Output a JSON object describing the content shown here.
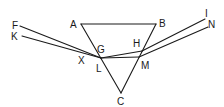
{
  "diagram": {
    "title": "",
    "type": "geometric-optics-prism",
    "colors": {
      "stroke": "#1a1a1a",
      "background": "#ffffff"
    },
    "points": {
      "A": {
        "label": "A",
        "x": 81,
        "y": 24,
        "lx": 70,
        "ly": 28
      },
      "B": {
        "label": "B",
        "x": 156,
        "y": 24,
        "lx": 159,
        "ly": 27
      },
      "C": {
        "label": "C",
        "x": 121,
        "y": 93,
        "lx": 117,
        "ly": 105
      },
      "F": {
        "label": "F",
        "x": 20,
        "y": 26,
        "lx": 12,
        "ly": 29
      },
      "K": {
        "label": "K",
        "x": 22,
        "y": 36,
        "lx": 11,
        "ly": 40
      },
      "G": {
        "label": "G",
        "x": 101,
        "y": 57,
        "lx": 97,
        "ly": 53
      },
      "X": {
        "label": "X",
        "x": 101,
        "y": 58,
        "lx": 78,
        "ly": 64
      },
      "L": {
        "label": "L",
        "x": 101,
        "y": 60,
        "lx": 96,
        "ly": 72
      },
      "H": {
        "label": "H",
        "x": 142,
        "y": 51,
        "lx": 133,
        "ly": 47
      },
      "M": {
        "label": "M",
        "x": 139,
        "y": 57,
        "lx": 141,
        "ly": 69
      },
      "I": {
        "label": "I",
        "x": 205,
        "y": 19,
        "lx": 205,
        "ly": 17
      },
      "N": {
        "label": "N",
        "x": 208,
        "y": 27,
        "lx": 208,
        "ly": 28
      }
    },
    "labels": [
      "A",
      "B",
      "C",
      "F",
      "K",
      "G",
      "X",
      "L",
      "H",
      "M",
      "I",
      "N"
    ],
    "segments": [
      {
        "from": "A",
        "to": "B",
        "name": "side-AB"
      },
      {
        "from": "A",
        "to": "C",
        "name": "side-AC"
      },
      {
        "from": "B",
        "to": "C",
        "name": "side-BC"
      },
      {
        "from": "F",
        "to": "X",
        "name": "ray-FX"
      },
      {
        "from": "K",
        "to": "X",
        "name": "ray-KX"
      },
      {
        "from": "X",
        "to": "H",
        "name": "ray-XH"
      },
      {
        "from": "X",
        "to": "M",
        "name": "ray-XM"
      },
      {
        "from": "H",
        "to": "I",
        "name": "ray-HI"
      },
      {
        "from": "M",
        "to": "N",
        "name": "ray-MN"
      }
    ]
  }
}
